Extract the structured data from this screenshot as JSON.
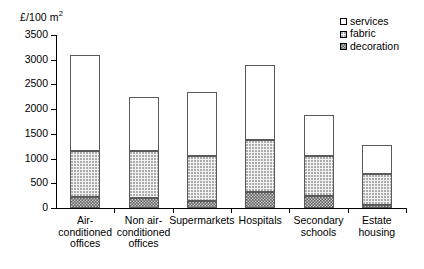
{
  "chart_data": {
    "type": "bar",
    "subtype": "stacked-bar",
    "title": "",
    "xlabel": "",
    "ylabel": "£/100 m²",
    "ylim": [
      0,
      3500
    ],
    "ytick_step": 500,
    "yticks": [
      0,
      500,
      1000,
      1500,
      2000,
      2500,
      3000,
      3500
    ],
    "ytick_labels": [
      "0",
      "500",
      "1000",
      "1500",
      "2000",
      "2500",
      "3000",
      "3500"
    ],
    "grid": false,
    "legend_position": "top-right",
    "categories": [
      "Air-conditioned offices",
      "Non air-conditioned offices",
      "Supermarkets",
      "Hospitals",
      "Secondary schools",
      "Estate housing"
    ],
    "category_label_lines": [
      [
        "Air-",
        "conditioned",
        "offices"
      ],
      [
        "Non air-",
        "conditioned",
        "offices"
      ],
      [
        "Supermarkets"
      ],
      [
        "Hospitals"
      ],
      [
        "Secondary",
        "schools"
      ],
      [
        "Estate",
        "housing"
      ]
    ],
    "series": [
      {
        "name": "decoration",
        "fill": "dark-hatched",
        "values": [
          225,
          200,
          140,
          330,
          250,
          60
        ]
      },
      {
        "name": "fabric",
        "fill": "light-dotted",
        "values": [
          925,
          950,
          910,
          1040,
          800,
          630
        ]
      },
      {
        "name": "services",
        "fill": "white",
        "values": [
          1950,
          1100,
          1300,
          1530,
          830,
          590
        ]
      }
    ],
    "totals": [
      3100,
      2250,
      2350,
      2900,
      1880,
      1280
    ],
    "segment_tops": {
      "decoration": [
        225,
        200,
        140,
        330,
        250,
        60
      ],
      "fabric": [
        1150,
        1150,
        1050,
        1370,
        1050,
        690
      ],
      "services": [
        3100,
        2250,
        2350,
        2900,
        1880,
        1280
      ]
    }
  },
  "legend": {
    "items": [
      {
        "label": "services",
        "swatch": "white-square-icon"
      },
      {
        "label": "fabric",
        "swatch": "dotted-square-icon"
      },
      {
        "label": "decoration",
        "swatch": "hatched-square-icon"
      }
    ]
  },
  "axis": {
    "y_title_main": "£/100 m",
    "y_title_sup": "2"
  },
  "colors": {
    "axis": "#000000",
    "bar_outline": "#5a5a5a",
    "services": "#ffffff",
    "fabric": "#f2f2f2",
    "decoration": "#8d8d8d",
    "background": "#ffffff"
  }
}
